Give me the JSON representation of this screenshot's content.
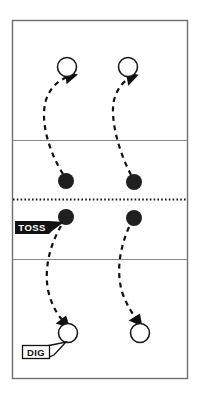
{
  "diagram": {
    "court": {
      "outline_color": "#6f6f6f",
      "court_fill": "#ffffff",
      "line_color": "#8a8a8a",
      "net_line_color": "#1a1a1a",
      "x": 12,
      "y": 20,
      "width": 175,
      "height": 358,
      "attack_line_top_y": 140,
      "net_y": 199,
      "attack_line_bottom_y": 259
    },
    "players": {
      "open_circle_color": "#1a1a1a",
      "filled_dot_color": "#202020",
      "open_circles": [
        {
          "id": "top-left-player",
          "cx": 67,
          "cy": 67,
          "r": 10
        },
        {
          "id": "top-right-player",
          "cx": 128,
          "cy": 67,
          "r": 10
        },
        {
          "id": "bottom-left-player",
          "cx": 68,
          "cy": 333,
          "r": 10
        },
        {
          "id": "bottom-right-player",
          "cx": 140,
          "cy": 333,
          "r": 10
        }
      ],
      "filled_dots": [
        {
          "id": "upper-left-ball",
          "cx": 66,
          "cy": 181,
          "r": 8
        },
        {
          "id": "upper-right-ball",
          "cx": 134,
          "cy": 182,
          "r": 8
        },
        {
          "id": "lower-left-ball",
          "cx": 66,
          "cy": 217,
          "r": 8
        },
        {
          "id": "lower-right-ball",
          "cx": 134,
          "cy": 218,
          "r": 8
        }
      ]
    },
    "paths": {
      "dash_color": "#111111",
      "dash_pattern": "5,4",
      "stroke_width": 2.2,
      "arrows": [
        {
          "id": "toss-up-left",
          "d": "M 63 174 C 48 150 40 120 46 100 C 51 85 62 78 72 76",
          "direction": "up"
        },
        {
          "id": "toss-up-right",
          "d": "M 131 175 C 118 150 110 118 114 100 C 118 86 126 79 133 77",
          "direction": "up"
        },
        {
          "id": "dig-down-left",
          "d": "M 61 226 C 50 245 44 268 48 290 C 52 308 60 318 66 324",
          "direction": "down"
        },
        {
          "id": "dig-down-right",
          "d": "M 129 227 C 120 248 116 270 122 292 C 128 308 134 316 139 322",
          "direction": "down"
        }
      ]
    },
    "labels": [
      {
        "id": "toss-label",
        "text": "TOSS",
        "style": "inverted",
        "background": "#111111",
        "text_color": "#ffffff",
        "x": 15,
        "y": 221,
        "width": 34,
        "height": 13
      },
      {
        "id": "dig-label",
        "text": "DIG",
        "style": "outlined",
        "background": "#ffffff",
        "text_color": "#111111",
        "border_color": "#111111",
        "x": 22,
        "y": 345,
        "width": 27,
        "height": 13
      }
    ]
  }
}
